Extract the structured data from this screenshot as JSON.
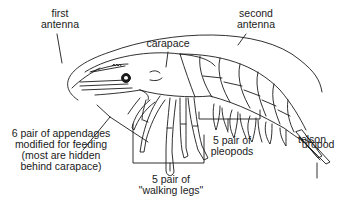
{
  "diagram": {
    "colors": {
      "ink": "#1a1a1a",
      "background": "#ffffff"
    },
    "labels": {
      "first_antenna": [
        "first",
        "antenna"
      ],
      "second_antenna": [
        "second",
        "antenna"
      ],
      "carapace": "carapace",
      "telson": "telson",
      "uropod": "uropod",
      "feeding_appendages": [
        "6 pair of appendages",
        "modified for feeding",
        "(most are hidden",
        "behind carapace)"
      ],
      "pleopods": [
        "5 pair of",
        "pleopods"
      ],
      "walking_legs": [
        "5 pair of",
        "\"walking legs\""
      ]
    }
  }
}
